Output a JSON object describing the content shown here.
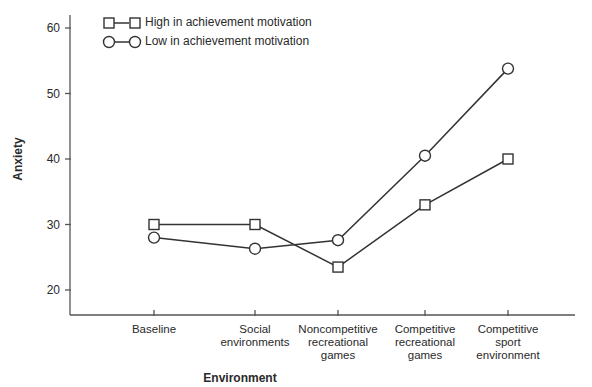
{
  "chart_data": {
    "type": "line",
    "title": "",
    "xlabel": "Environment",
    "ylabel": "Anxiety",
    "ylim": [
      16,
      62
    ],
    "yticks": [
      20,
      30,
      40,
      50,
      60
    ],
    "grid": false,
    "legend_position": "top-left",
    "categories": [
      "Baseline",
      "Social environments",
      "Noncompetitive recreational games",
      "Competitive recreational games",
      "Competitive sport environment"
    ],
    "category_lines": [
      [
        "Baseline"
      ],
      [
        "Social",
        "environments"
      ],
      [
        "Noncompetitive",
        "recreational",
        "games"
      ],
      [
        "Competitive",
        "recreational",
        "games"
      ],
      [
        "Competitive",
        "sport",
        "environment"
      ]
    ],
    "series": [
      {
        "name": "High in achievement motivation",
        "marker": "square",
        "values": [
          30,
          30,
          23.5,
          33,
          40
        ]
      },
      {
        "name": "Low in achievement motivation",
        "marker": "circle",
        "values": [
          28,
          26.3,
          27.6,
          40.5,
          53.8
        ]
      }
    ]
  },
  "colors": {
    "line": "#333333",
    "axis": "#555555",
    "marker_fill": "#ffffff"
  }
}
